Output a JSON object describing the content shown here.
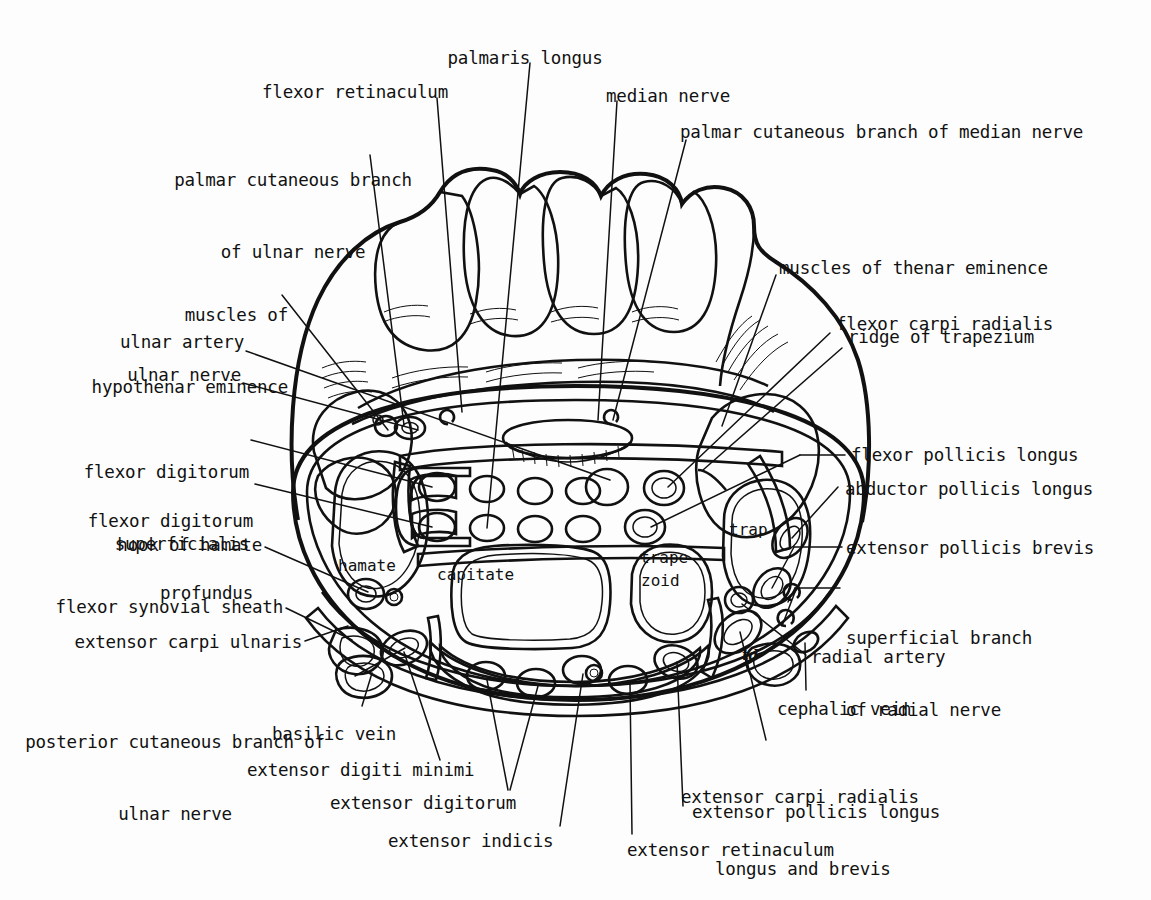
{
  "figure": {
    "signature": "td"
  },
  "bone_labels": [
    {
      "id": "hamate",
      "text": "hamate"
    },
    {
      "id": "capitate",
      "text": "capitate"
    },
    {
      "id": "trapezoid1",
      "text": "trape-"
    },
    {
      "id": "trapezoid2",
      "text": "zoid"
    },
    {
      "id": "trapezium",
      "text": "trap"
    }
  ],
  "labels_top": [
    {
      "id": "palmaris-longus",
      "lines": [
        "palmaris longus"
      ]
    },
    {
      "id": "flexor-retinaculum",
      "lines": [
        "flexor retinaculum"
      ]
    },
    {
      "id": "median-nerve",
      "lines": [
        "median nerve"
      ]
    },
    {
      "id": "palmar-cutaneous-branch-ulnar",
      "lines": [
        "palmar cutaneous branch",
        "of ulnar nerve"
      ]
    },
    {
      "id": "palmar-cutaneous-branch-median",
      "lines": [
        "palmar cutaneous branch of median nerve"
      ]
    }
  ],
  "labels_left": [
    {
      "id": "muscles-hypothenar-eminence",
      "lines": [
        "muscles of",
        "hypothenar eminence"
      ]
    },
    {
      "id": "ulnar-artery",
      "lines": [
        "ulnar artery"
      ]
    },
    {
      "id": "ulnar-nerve",
      "lines": [
        "ulnar nerve"
      ]
    },
    {
      "id": "flexor-digitorum-superficialis",
      "lines": [
        "flexor digitorum",
        "superficialis"
      ]
    },
    {
      "id": "flexor-digitorum-profundus",
      "lines": [
        "flexor digitorum",
        "profundus"
      ]
    },
    {
      "id": "hook-of-hamate",
      "lines": [
        "hook of hamate"
      ]
    },
    {
      "id": "flexor-synovial-sheath",
      "lines": [
        "flexor synovial sheath"
      ]
    },
    {
      "id": "extensor-carpi-ulnaris",
      "lines": [
        "extensor carpi ulnaris"
      ]
    },
    {
      "id": "posterior-cutaneous-branch-ulnar",
      "lines": [
        "posterior cutaneous branch of",
        "ulnar nerve"
      ]
    }
  ],
  "labels_right": [
    {
      "id": "muscles-thenar-eminence",
      "lines": [
        "muscles of thenar eminence"
      ]
    },
    {
      "id": "flexor-carpi-radialis",
      "lines": [
        "flexor carpi radialis"
      ]
    },
    {
      "id": "ridge-of-trapezium",
      "lines": [
        "ridge of trapezium"
      ]
    },
    {
      "id": "flexor-pollicis-longus",
      "lines": [
        "flexor pollicis longus"
      ]
    },
    {
      "id": "abductor-pollicis-longus",
      "lines": [
        "abductor pollicis longus"
      ]
    },
    {
      "id": "extensor-pollicis-brevis",
      "lines": [
        "extensor pollicis brevis"
      ]
    },
    {
      "id": "superficial-branch-radial-nerve",
      "lines": [
        "superficial branch",
        "of radial nerve"
      ]
    },
    {
      "id": "radial-artery",
      "lines": [
        "radial artery"
      ]
    },
    {
      "id": "cephalic-vein",
      "lines": [
        "cephalic vein"
      ]
    },
    {
      "id": "extensor-carpi-radialis",
      "lines": [
        "extensor carpi radialis",
        "longus and brevis"
      ]
    },
    {
      "id": "extensor-pollicis-longus",
      "lines": [
        "extensor pollicis longus"
      ]
    }
  ],
  "labels_bottom": [
    {
      "id": "basilic-vein",
      "lines": [
        "basilic vein"
      ]
    },
    {
      "id": "extensor-digiti-minimi",
      "lines": [
        "extensor digiti minimi"
      ]
    },
    {
      "id": "extensor-digitorum",
      "lines": [
        "extensor digitorum"
      ]
    },
    {
      "id": "extensor-indicis",
      "lines": [
        "extensor indicis"
      ]
    },
    {
      "id": "extensor-retinaculum",
      "lines": [
        "extensor retinaculum"
      ]
    }
  ],
  "colors": {
    "ink": "#111111",
    "paper": "#ffffff",
    "tendon_fill": "#a8a8a8",
    "muscle_fill": "#8a8a8a",
    "sheath_fill": "#b9b9b9",
    "bone_fill": "#fbfbfb",
    "section_fill": "#f2f2f0"
  }
}
